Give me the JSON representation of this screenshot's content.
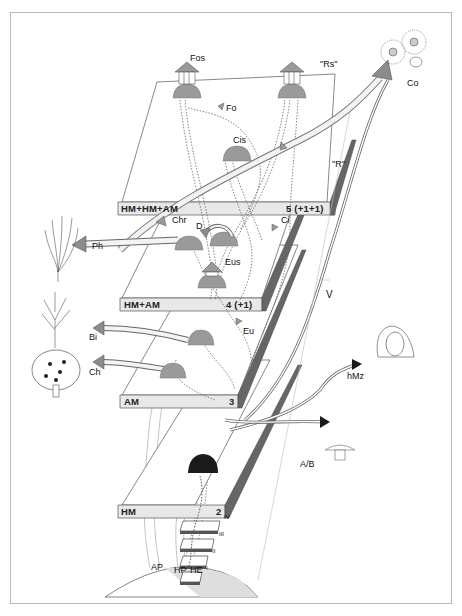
{
  "diagram": {
    "colors": {
      "plate_edge": "#e6e6e6",
      "plate_line": "#555555",
      "cap_grey": "#9a9a9a",
      "cap_black": "#1a1a1a",
      "arrow_grey": "#8c8c8c",
      "frame": "#b9b9b9"
    },
    "plates": [
      {
        "level": "5 (+1+1)",
        "label": "HM+HM+AM"
      },
      {
        "level": "4 (+1)",
        "label": "HM+AM"
      },
      {
        "level": "3",
        "label": "AM"
      },
      {
        "level": "2",
        "label": "HM"
      }
    ],
    "steps": [
      "IV",
      "III",
      "II",
      "I"
    ],
    "base_labels": {
      "ap": "AP",
      "hp": "HP",
      "he": "HE"
    },
    "top_plate_labels": {
      "fos": "Fos",
      "fo": "Fo",
      "cis": "Cis",
      "rs": "\"Rs\"",
      "r": "\"R\""
    },
    "mid_labels": {
      "chr": "Chr",
      "d": "D",
      "ci": "Ci",
      "eus": "Eus",
      "eu": "Eu"
    },
    "side_outputs": {
      "ph": "Ph",
      "bi": "Bi",
      "ch": "Ch",
      "co": "Co",
      "v": "V",
      "hmz": "hMz",
      "ab": "A/B"
    },
    "icons": [
      "seaweed-icon",
      "bare-tree-icon",
      "leafy-tree-icon",
      "sea-anemone-icon",
      "human-face-icon",
      "mushroom-icon"
    ]
  }
}
